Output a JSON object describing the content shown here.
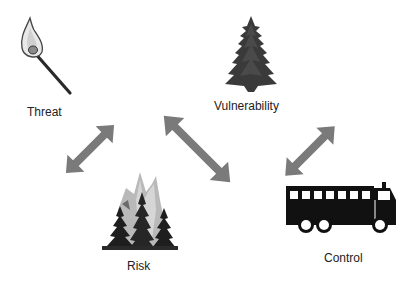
{
  "diagram": {
    "nodes": [
      {
        "id": "threat",
        "label": "Threat",
        "icon": "burning-match-icon"
      },
      {
        "id": "vulnerability",
        "label": "Vulnerability",
        "icon": "pine-tree-icon"
      },
      {
        "id": "risk",
        "label": "Risk",
        "icon": "forest-fire-icon"
      },
      {
        "id": "control",
        "label": "Control",
        "icon": "fire-truck-icon"
      }
    ],
    "edges": [
      {
        "from": "threat",
        "to": "risk",
        "type": "bidirectional"
      },
      {
        "from": "vulnerability",
        "to": "risk",
        "type": "bidirectional"
      },
      {
        "from": "vulnerability",
        "to": "control",
        "type": "bidirectional"
      }
    ],
    "colors": {
      "arrow": "#7a7a7a",
      "icon_dark": "#1a1a1a",
      "label": "#222222",
      "background": "#ffffff"
    }
  }
}
